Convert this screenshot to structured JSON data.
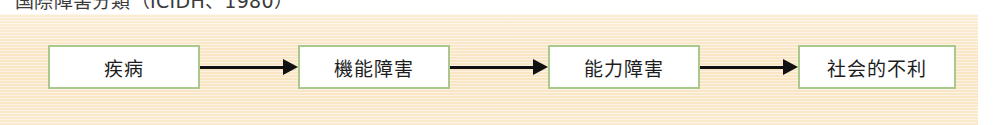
{
  "heading": {
    "bullet": "dash-bullet",
    "text": "国際障害分類（ICIDH、1980）"
  },
  "panel": {
    "background_color": "#fae5c3",
    "name": "slide-content-panel"
  },
  "diagram": {
    "type": "linear-flow",
    "node_border_color": "#a9c98c",
    "node_fill_color": "#ffffff",
    "arrow_color": "#111111",
    "nodes": [
      {
        "label": "疾病"
      },
      {
        "label": "機能障害"
      },
      {
        "label": "能力障害"
      },
      {
        "label": "社会的不利"
      }
    ],
    "connectors": [
      {
        "icon": "arrow-right-icon"
      },
      {
        "icon": "arrow-right-icon"
      },
      {
        "icon": "arrow-right-icon"
      }
    ]
  }
}
